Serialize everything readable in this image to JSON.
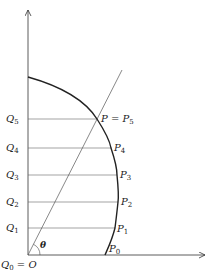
{
  "diagram": {
    "axes": {
      "x_arrow": true,
      "y_arrow": true
    },
    "origin_label": {
      "main": "Q",
      "sub": "0",
      "suffix": " = O"
    },
    "angle_label": "θ",
    "q_labels": [
      {
        "main": "Q",
        "sub": "1"
      },
      {
        "main": "Q",
        "sub": "2"
      },
      {
        "main": "Q",
        "sub": "3"
      },
      {
        "main": "Q",
        "sub": "4"
      },
      {
        "main": "Q",
        "sub": "5"
      }
    ],
    "p_labels": [
      {
        "prefix": "",
        "main": "P",
        "sub": "0"
      },
      {
        "prefix": "",
        "main": "P",
        "sub": "1"
      },
      {
        "prefix": "",
        "main": "P",
        "sub": "2"
      },
      {
        "prefix": "",
        "main": "P",
        "sub": "3"
      },
      {
        "prefix": "",
        "main": "P",
        "sub": "4"
      },
      {
        "prefix": "P = ",
        "main": "P",
        "sub": "5"
      }
    ],
    "colors": {
      "ink": "#222222",
      "thin": "#555555"
    }
  }
}
